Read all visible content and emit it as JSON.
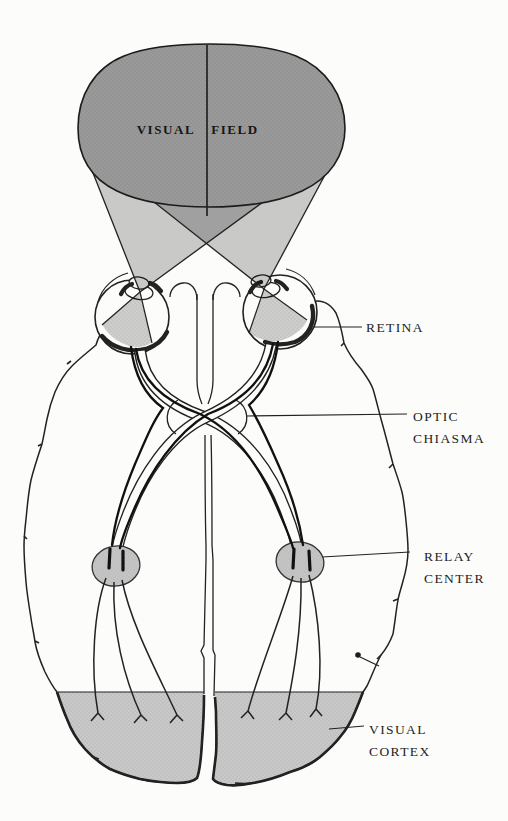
{
  "diagram": {
    "visual_field": {
      "left": "VISUAL",
      "right": "FIELD"
    },
    "labels": {
      "retina": "RETINA",
      "optic_chiasma": [
        "OPTIC",
        "CHIASMA"
      ],
      "relay_center": [
        "RELAY",
        "CENTER"
      ],
      "visual_cortex": [
        "VISUAL",
        "CORTEX"
      ]
    },
    "colors": {
      "paper": "#fcfcfa",
      "ink": "#1e1e1e",
      "field_fill": "#9a9a9a",
      "cone_shade": "rgba(0,0,0,0.20)",
      "wedge_shade": "rgba(0,0,0,0.18)",
      "relay_fill": "#c6c6c6",
      "cortex_fill": "#c9c9c9"
    }
  }
}
